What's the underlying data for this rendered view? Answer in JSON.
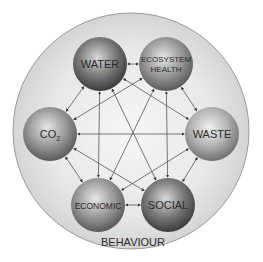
{
  "diagram": {
    "outer_label": "BEHAVIOUR",
    "nodes": [
      {
        "id": "water",
        "label": "WATER",
        "cx": 100,
        "cy": 64,
        "shade": "dark"
      },
      {
        "id": "ecosystem",
        "label": "ECOSYSTEM",
        "label2": "HEALTH",
        "cx": 166,
        "cy": 64,
        "shade": "mid"
      },
      {
        "id": "co2",
        "label": "CO",
        "sub": "2",
        "cx": 50,
        "cy": 134,
        "shade": "mid"
      },
      {
        "id": "waste",
        "label": "WASTE",
        "cx": 212,
        "cy": 134,
        "shade": "light"
      },
      {
        "id": "economic",
        "label": "ECONOMIC",
        "cx": 98,
        "cy": 205,
        "shade": "mid"
      },
      {
        "id": "social",
        "label": "SOCIAL",
        "cx": 168,
        "cy": 205,
        "shade": "dark"
      }
    ],
    "edges": [
      [
        "water",
        "ecosystem"
      ],
      [
        "water",
        "co2"
      ],
      [
        "water",
        "economic"
      ],
      [
        "water",
        "social"
      ],
      [
        "water",
        "waste"
      ],
      [
        "ecosystem",
        "waste"
      ],
      [
        "ecosystem",
        "co2"
      ],
      [
        "ecosystem",
        "economic"
      ],
      [
        "ecosystem",
        "social"
      ],
      [
        "co2",
        "waste"
      ],
      [
        "co2",
        "economic"
      ],
      [
        "co2",
        "social"
      ],
      [
        "waste",
        "social"
      ],
      [
        "waste",
        "economic"
      ],
      [
        "economic",
        "social"
      ]
    ]
  }
}
